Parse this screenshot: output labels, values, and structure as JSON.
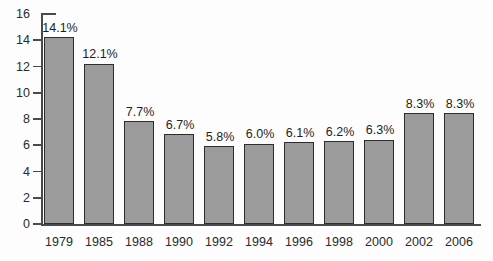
{
  "chart_data": {
    "type": "bar",
    "title": "",
    "subtitle": "",
    "xlabel": "",
    "ylabel": "",
    "categories": [
      "1979",
      "1985",
      "1988",
      "1990",
      "1992",
      "1994",
      "1996",
      "1998",
      "2000",
      "2002",
      "2006"
    ],
    "values": [
      14.1,
      12.1,
      7.7,
      6.7,
      5.8,
      6.0,
      6.1,
      6.2,
      6.3,
      8.3,
      8.3
    ],
    "data_labels": [
      "14.1%",
      "12.1%",
      "7.7%",
      "6.7%",
      "5.8%",
      "6.0%",
      "6.1%",
      "6.2%",
      "6.3%",
      "8.3%",
      "8.3%"
    ],
    "ylim": [
      0,
      16
    ],
    "ytick_values": [
      0,
      2,
      4,
      6,
      8,
      10,
      12,
      14,
      16
    ],
    "ytick_labels": [
      "0",
      "2",
      "4",
      "6",
      "8",
      "10",
      "12",
      "14",
      "16"
    ],
    "grid": false,
    "legend": null,
    "legend_position": "none",
    "series": [
      {
        "name": "",
        "values": [
          14.1,
          12.1,
          7.7,
          6.7,
          5.8,
          6.0,
          6.1,
          6.2,
          6.3,
          8.3,
          8.3
        ]
      }
    ],
    "colors": {
      "bar_fill": "#9b9b9b",
      "bar_border": "#2d2d2d",
      "axis": "#4a4a4a",
      "text": "#1e1e1e",
      "background": "#fdfdfd"
    }
  }
}
